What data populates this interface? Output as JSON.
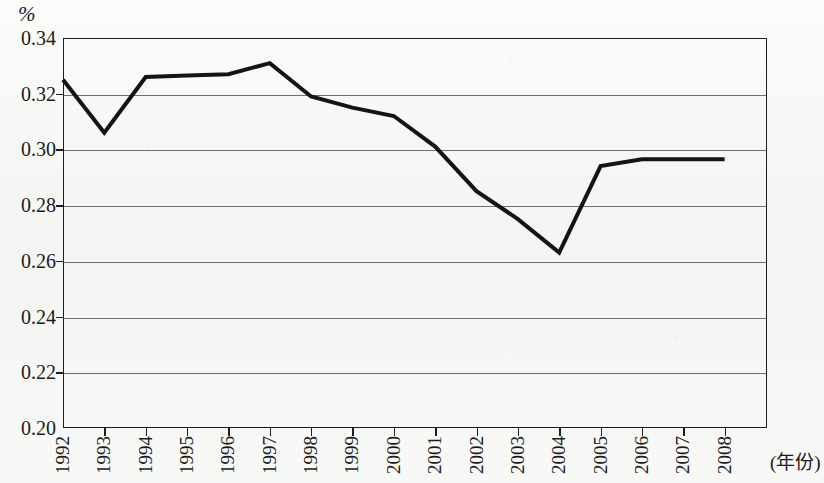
{
  "unit_label": "%",
  "xaxis_title": "(年份)",
  "chart_data": {
    "type": "line",
    "title": "",
    "subtitle": "",
    "xlabel": "(年份)",
    "ylabel": "%",
    "ylim": [
      0.2,
      0.34
    ],
    "ytick_step": 0.02,
    "yticks": [
      "0.34",
      "0.32",
      "0.30",
      "0.28",
      "0.26",
      "0.24",
      "0.22",
      "0.20"
    ],
    "ytick_values": [
      0.34,
      0.32,
      0.3,
      0.28,
      0.26,
      0.24,
      0.22,
      0.2
    ],
    "grid": true,
    "grid_axis": "y",
    "legend": "none",
    "categories": [
      "1992",
      "1993",
      "1994",
      "1995",
      "1996",
      "1997",
      "1998",
      "1999",
      "2000",
      "2001",
      "2002",
      "2003",
      "2004",
      "2005",
      "2006",
      "2007",
      "2008"
    ],
    "series": [
      {
        "name": "",
        "color": "#141414",
        "line_width": 4,
        "values": [
          0.325,
          0.306,
          0.326,
          0.3265,
          0.327,
          0.331,
          0.319,
          0.315,
          0.312,
          0.301,
          0.285,
          0.275,
          0.263,
          0.294,
          0.2965,
          0.2965,
          0.2965
        ]
      }
    ]
  },
  "colors": {
    "line": "#141414",
    "axis": "#1d1d1d",
    "grid": "#6f6f6f",
    "background": "#f7f7f5",
    "text": "#1b1b1b"
  }
}
